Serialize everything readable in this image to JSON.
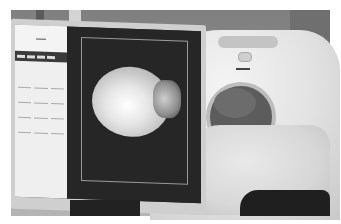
{
  "scene": {
    "description": "Photograph of a CT scanner room with a monitor displaying a skull X-ray scout image while a patient lies on the scanner table",
    "colors": {
      "wall": "#8a8a8a",
      "gantry": "#e2e2e2",
      "screen_bg": "#262626",
      "side_panel": "#efefef"
    }
  },
  "monitor": {
    "side_panel": {
      "header_text": "",
      "toolbar_items": 4,
      "grid_buttons": 12
    },
    "viewer": {
      "image": "skull-lateral-xray"
    }
  }
}
